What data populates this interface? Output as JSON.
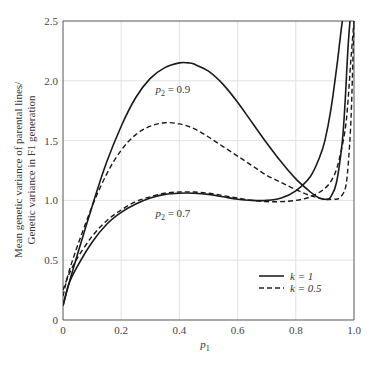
{
  "chart_data": {
    "type": "line",
    "title": "",
    "xlabel": "p1",
    "xlabel_parts": {
      "base": "p",
      "sub": "1"
    },
    "ylabel_lines": [
      "Mean genetic variance of parental lines/",
      "Genetic variance in F1 generation"
    ],
    "xlim": [
      0,
      1.0
    ],
    "ylim": [
      0,
      2.5
    ],
    "grid": true,
    "x_ticks": [
      0,
      0.2,
      0.4,
      0.6,
      0.8,
      1.0
    ],
    "x_tick_labels": [
      "0",
      "0.2",
      "0.4",
      "0.6",
      "0.8",
      "1.0"
    ],
    "y_ticks": [
      0,
      0.5,
      1.0,
      1.5,
      2.0,
      2.5
    ],
    "y_tick_labels": [
      "0",
      "0.5",
      "1.0",
      "1.5",
      "2.0",
      "2.5"
    ],
    "legend_position": "lower right",
    "legend": [
      {
        "label": "k = 1",
        "style": "solid"
      },
      {
        "label": "k = 0.5",
        "style": "dashed"
      }
    ],
    "annotations": [
      {
        "text": "p2 = 0.9",
        "x": 0.4,
        "y": 1.9
      },
      {
        "text": "p2 = 0.7",
        "x": 0.4,
        "y": 0.86
      }
    ],
    "series": [
      {
        "name": "p2 = 0.9, k = 1",
        "style": "solid",
        "x": [
          0.0,
          0.02,
          0.05,
          0.1,
          0.15,
          0.2,
          0.25,
          0.3,
          0.35,
          0.4,
          0.43,
          0.45,
          0.5,
          0.55,
          0.6,
          0.65,
          0.7,
          0.75,
          0.8,
          0.85,
          0.88,
          0.9,
          0.91,
          0.92,
          0.94,
          0.96,
          0.97,
          0.98,
          0.99
        ],
        "y": [
          0.12,
          0.3,
          0.55,
          0.95,
          1.32,
          1.62,
          1.86,
          2.02,
          2.11,
          2.15,
          2.15,
          2.14,
          2.08,
          1.97,
          1.82,
          1.65,
          1.48,
          1.32,
          1.18,
          1.07,
          1.02,
          1.01,
          1.01,
          1.03,
          1.15,
          1.5,
          1.85,
          2.3,
          2.6
        ]
      },
      {
        "name": "p2 = 0.9, k = 0.5",
        "style": "dashed",
        "x": [
          0.0,
          0.02,
          0.05,
          0.1,
          0.15,
          0.2,
          0.25,
          0.3,
          0.35,
          0.4,
          0.45,
          0.5,
          0.55,
          0.6,
          0.65,
          0.7,
          0.75,
          0.8,
          0.85,
          0.9,
          0.93,
          0.95,
          0.97,
          0.98,
          0.99,
          1.0
        ],
        "y": [
          0.2,
          0.4,
          0.62,
          0.95,
          1.22,
          1.42,
          1.55,
          1.62,
          1.65,
          1.64,
          1.6,
          1.53,
          1.45,
          1.37,
          1.29,
          1.21,
          1.15,
          1.09,
          1.04,
          1.01,
          1.01,
          1.02,
          1.1,
          1.3,
          1.7,
          2.5
        ]
      },
      {
        "name": "p2 = 0.7, k = 1",
        "style": "solid",
        "x": [
          0.0,
          0.02,
          0.05,
          0.1,
          0.15,
          0.2,
          0.25,
          0.3,
          0.35,
          0.4,
          0.45,
          0.5,
          0.55,
          0.6,
          0.65,
          0.7,
          0.75,
          0.8,
          0.85,
          0.88,
          0.9,
          0.92,
          0.94,
          0.95,
          0.96,
          0.97
        ],
        "y": [
          0.12,
          0.3,
          0.45,
          0.65,
          0.8,
          0.9,
          0.97,
          1.02,
          1.05,
          1.06,
          1.06,
          1.05,
          1.03,
          1.01,
          1.0,
          1.0,
          1.02,
          1.08,
          1.2,
          1.35,
          1.5,
          1.75,
          2.1,
          2.3,
          2.5,
          2.6
        ]
      },
      {
        "name": "p2 = 0.7, k = 0.5",
        "style": "dashed",
        "x": [
          0.0,
          0.02,
          0.05,
          0.1,
          0.15,
          0.2,
          0.25,
          0.3,
          0.35,
          0.4,
          0.45,
          0.5,
          0.55,
          0.6,
          0.65,
          0.7,
          0.75,
          0.8,
          0.85,
          0.9,
          0.93,
          0.95,
          0.97,
          0.98,
          0.99,
          1.0
        ],
        "y": [
          0.25,
          0.38,
          0.52,
          0.7,
          0.83,
          0.92,
          0.99,
          1.03,
          1.06,
          1.07,
          1.07,
          1.06,
          1.04,
          1.02,
          1.0,
          0.99,
          0.99,
          1.0,
          1.03,
          1.1,
          1.2,
          1.35,
          1.6,
          1.85,
          2.2,
          2.5
        ]
      }
    ]
  }
}
